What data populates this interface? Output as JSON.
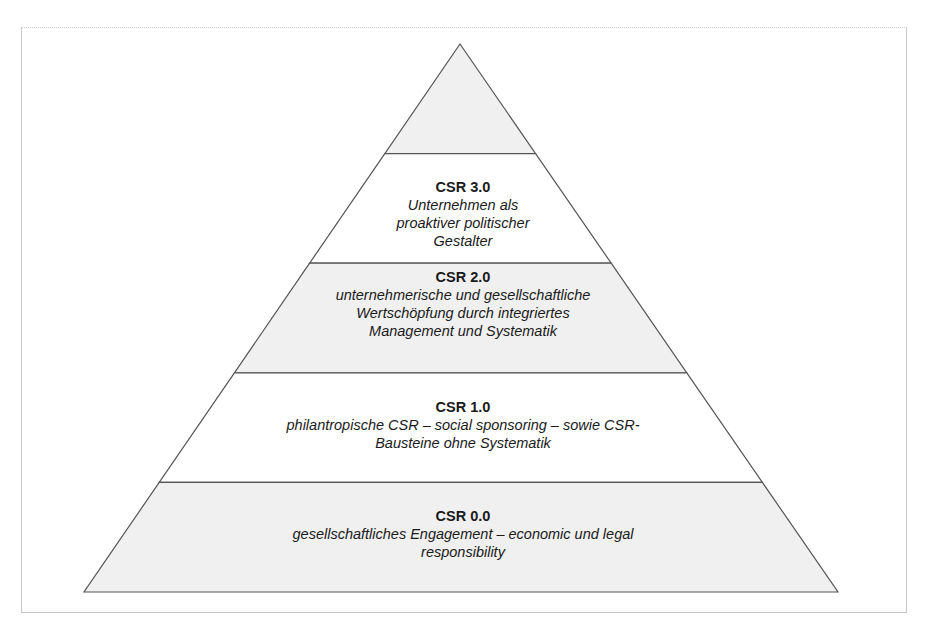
{
  "diagram": {
    "type": "pyramid",
    "colors": {
      "shaded": "#f0f0f0",
      "plain": "#ffffff",
      "stroke": "#555555"
    },
    "levels": [
      {
        "id": "top",
        "title": "",
        "description": "",
        "shaded": true
      },
      {
        "id": "csr-3",
        "title": "CSR 3.0",
        "description": "Unternehmen als proaktiver politischer Gestalter",
        "shaded": false
      },
      {
        "id": "csr-2",
        "title": "CSR 2.0",
        "description": "unternehmerische und gesellschaftliche Wertschöpfung durch integriertes Management und Systematik",
        "shaded": true
      },
      {
        "id": "csr-1",
        "title": "CSR 1.0",
        "description": "philantropische CSR – social sponsoring – sowie CSR-Bausteine ohne Systematik",
        "shaded": false
      },
      {
        "id": "csr-0",
        "title": "CSR 0.0",
        "description": "gesellschaftliches Engagement – economic und legal responsibility",
        "shaded": true
      }
    ]
  }
}
